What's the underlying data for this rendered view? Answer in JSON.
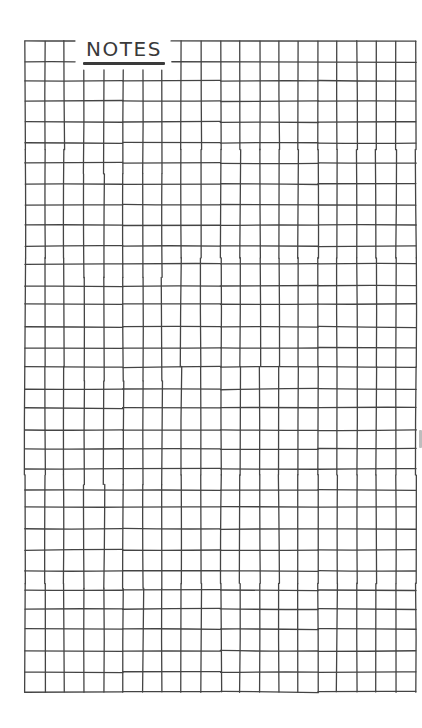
{
  "page": {
    "type": "grid-notes-sheet",
    "title": "NOTES",
    "background_color": "#ffffff",
    "line_color": "#444444",
    "text_color": "#3a3a3a"
  },
  "grid": {
    "columns": 20,
    "rows": 32,
    "column_lines_x": [
      25,
      45,
      64,
      84,
      104,
      123,
      143,
      162,
      181,
      201,
      221,
      240,
      260,
      279,
      298,
      318,
      337,
      357,
      376,
      396,
      416
    ],
    "row_lines_y": [
      41,
      62,
      81,
      101,
      122,
      143,
      163,
      184,
      205,
      225,
      246,
      264,
      286,
      304,
      327,
      348,
      367,
      389,
      408,
      430,
      449,
      469,
      490,
      507,
      529,
      550,
      571,
      590,
      609,
      629,
      651,
      672,
      692
    ],
    "title_gap": {
      "top_border_gap_x": [
        75,
        171
      ],
      "first_row_gap_x": [
        75,
        172
      ],
      "vertical_lines_start_below_title_y": 70
    }
  }
}
